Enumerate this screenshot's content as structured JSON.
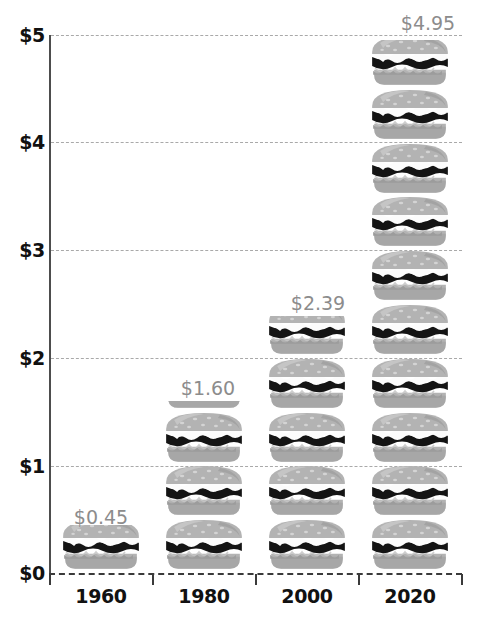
{
  "chart_data": {
    "type": "bar",
    "subtype": "pictogram-stacked-bar",
    "title": "",
    "subtitle": "",
    "xlabel": "",
    "ylabel": "",
    "categories": [
      "1960",
      "1980",
      "2000",
      "2020"
    ],
    "values": [
      0.45,
      1.6,
      2.39,
      4.95
    ],
    "value_labels": [
      "$0.45",
      "$1.60",
      "$2.39",
      "$4.95"
    ],
    "ylim": [
      0,
      5
    ],
    "y_ticks": [
      0,
      1,
      2,
      3,
      4,
      5
    ],
    "y_tick_labels": [
      "$0",
      "$1",
      "$2",
      "$3",
      "$4",
      "$5"
    ],
    "grid": true,
    "grid_style": "dashed-horizontal",
    "legend": "none",
    "icon": "burger-icon",
    "icon_unit_value": 0.5,
    "icon_counts": [
      1,
      4,
      5,
      10
    ],
    "series": [
      {
        "name": "Average burger price",
        "values": [
          0.45,
          1.6,
          2.39,
          4.95
        ]
      }
    ]
  },
  "axes": {
    "y_tick_labels": [
      "$5",
      "$4",
      "$3",
      "$2",
      "$1",
      "$0"
    ],
    "x_tick_labels": [
      "1960",
      "1980",
      "2000",
      "2020"
    ]
  },
  "labels": {
    "v0": "$0.45",
    "v1": "$1.60",
    "v2": "$2.39",
    "v3": "$4.95"
  },
  "colors": {
    "background": "#ffffff",
    "axis": "#3a3a3a",
    "gridline": "#a9a9a9",
    "tick_text": "#111111",
    "value_text": "#8c8c8c",
    "bun": "#b3b3b3",
    "bun_shade": "#9c9c9c",
    "bun_highlight": "#c6c6c6",
    "lettuce": "#fcfcfc",
    "patty": "#141414",
    "sesame": "#d4d4d4"
  }
}
